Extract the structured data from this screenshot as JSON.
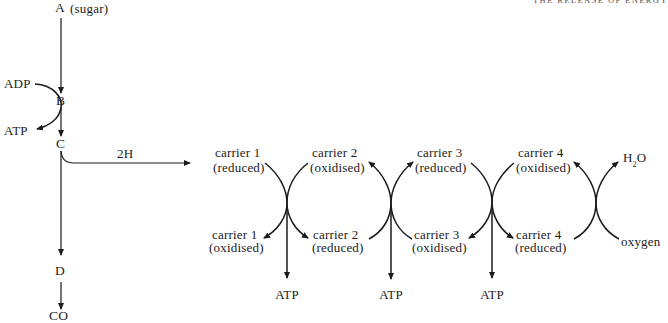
{
  "header": {
    "running_title": "THE RELEASE OF ENERGY"
  },
  "pathway": {
    "step_a": "A",
    "step_a_note": "(sugar)",
    "step_b": "B",
    "step_c": "C",
    "step_d": "D",
    "end_product": "CO",
    "adp": "ADP",
    "atp": "ATP",
    "hydrogen": "2H"
  },
  "chain": {
    "top": [
      {
        "name": "carrier 1",
        "state": "(reduced)"
      },
      {
        "name": "carrier 2",
        "state": "(oxidised)"
      },
      {
        "name": "carrier 3",
        "state": "(reduced)"
      },
      {
        "name": "carrier 4",
        "state": "(oxidised)"
      }
    ],
    "bottom": [
      {
        "name": "carrier 1",
        "state": "(oxidised)"
      },
      {
        "name": "carrier 2",
        "state": "(reduced)"
      },
      {
        "name": "carrier 3",
        "state": "(oxidised)"
      },
      {
        "name": "carrier 4",
        "state": "(reduced)"
      }
    ],
    "water": {
      "base1": "H",
      "subscript": "2",
      "base2": "O"
    },
    "oxygen": "oxygen",
    "atp_outputs": [
      "ATP",
      "ATP",
      "ATP"
    ]
  },
  "colors": {
    "ink": "#1c1c1c",
    "background": "#ffffff"
  }
}
